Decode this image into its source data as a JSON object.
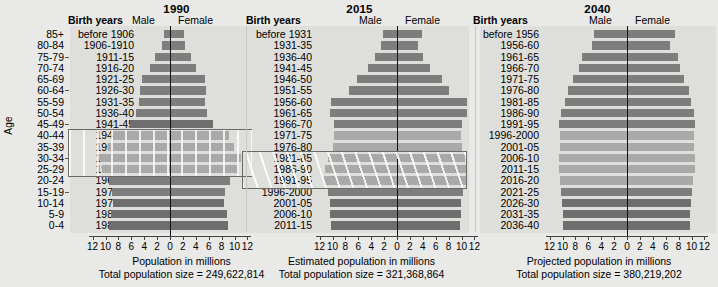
{
  "axis": {
    "age_title": "Age",
    "age_groups": [
      "85+",
      "80-84",
      "75-79",
      "70-74",
      "65-69",
      "60-64",
      "55-59",
      "50-54",
      "45-49",
      "40-44",
      "35-39",
      "30-34",
      "25-29",
      "20-24",
      "15-19",
      "10-14",
      "5-9",
      "0-4"
    ],
    "age_ticks_at": [
      "75-79",
      "60-64",
      "45-49",
      "30-34",
      "15-19"
    ],
    "x_tick_labels": [
      "12",
      "10",
      "8",
      "6",
      "4",
      "2",
      "0",
      "2",
      "4",
      "6",
      "8",
      "10",
      "12"
    ],
    "x_tick_values": [
      -12,
      -10,
      -8,
      -6,
      -4,
      -2,
      0,
      2,
      4,
      6,
      8,
      10,
      12
    ],
    "xlim": [
      -13,
      13
    ]
  },
  "headers": {
    "birth_years": "Birth years",
    "male": "Male",
    "female": "Female"
  },
  "colors": {
    "bar_dark": "#6e6e6e",
    "bar_mid": "#7d7d7d",
    "bar_light": "#a9a9a9",
    "plot_bg": "#dededa",
    "page_bg": "#e9e9e7",
    "zero_line": "#111111",
    "hatch_border": "#6a6a6a"
  },
  "chart_data": {
    "type": "bar",
    "xlabel": "Population in millions",
    "ylabel": "Age",
    "grid": false,
    "legend": [
      "Male",
      "Female"
    ],
    "legend_position": "top",
    "panels": [
      {
        "title": "1990",
        "xlabel": "Population in millions",
        "total_label": "Total population size = 249,622,814",
        "total_population": 249622814,
        "highlight": {
          "label": "baby boom cohort",
          "style": "slanted-hatch",
          "rows": [
            "40-44",
            "35-39",
            "30-34",
            "25-29"
          ]
        },
        "rows": [
          {
            "age": "85+",
            "birth_years": "before 1906",
            "male": 1.0,
            "female": 2.2,
            "shade": "mid"
          },
          {
            "age": "80-84",
            "birth_years": "1906-1910",
            "male": 1.3,
            "female": 2.3,
            "shade": "mid"
          },
          {
            "age": "75-79",
            "birth_years": "1911-15",
            "male": 2.3,
            "female": 3.3,
            "shade": "mid"
          },
          {
            "age": "70-74",
            "birth_years": "1916-20",
            "male": 3.1,
            "female": 4.1,
            "shade": "mid"
          },
          {
            "age": "65-69",
            "birth_years": "1921-25",
            "male": 4.3,
            "female": 5.5,
            "shade": "mid"
          },
          {
            "age": "60-64",
            "birth_years": "1926-30",
            "male": 4.7,
            "female": 5.6,
            "shade": "mid"
          },
          {
            "age": "55-59",
            "birth_years": "1931-35",
            "male": 4.8,
            "female": 5.4,
            "shade": "mid"
          },
          {
            "age": "50-54",
            "birth_years": "1936-40",
            "male": 5.3,
            "female": 5.8,
            "shade": "mid"
          },
          {
            "age": "45-49",
            "birth_years": "1941-45",
            "male": 6.2,
            "female": 6.6,
            "shade": "dark"
          },
          {
            "age": "40-44",
            "birth_years": "1946-50",
            "male": 8.9,
            "female": 9.2,
            "shade": "light"
          },
          {
            "age": "35-39",
            "birth_years": "1951-55",
            "male": 9.6,
            "female": 9.9,
            "shade": "light"
          },
          {
            "age": "30-34",
            "birth_years": "1956-60",
            "male": 10.9,
            "female": 11.0,
            "shade": "light"
          },
          {
            "age": "25-29",
            "birth_years": "1961-65",
            "male": 10.6,
            "female": 10.7,
            "shade": "light"
          },
          {
            "age": "20-24",
            "birth_years": "1966-70",
            "male": 9.4,
            "female": 9.3,
            "shade": "mid"
          },
          {
            "age": "15-19",
            "birth_years": "1971-75",
            "male": 9.0,
            "female": 8.6,
            "shade": "mid"
          },
          {
            "age": "10-14",
            "birth_years": "1976-80",
            "male": 8.8,
            "female": 8.4,
            "shade": "dark"
          },
          {
            "age": "5-9",
            "birth_years": "1981-85",
            "male": 9.2,
            "female": 8.8,
            "shade": "dark"
          },
          {
            "age": "0-4",
            "birth_years": "1986-90",
            "male": 9.4,
            "female": 9.0,
            "shade": "dark"
          }
        ]
      },
      {
        "title": "2015",
        "xlabel": "Estimated population in millions",
        "total_label": "Total population size = 321,368,864",
        "total_population": 321368864,
        "highlight": {
          "label": "baby boom echo cohort",
          "style": "slanted-hatch",
          "rows": [
            "30-34",
            "25-29",
            "20-24"
          ]
        },
        "rows": [
          {
            "age": "85+",
            "birth_years": "before 1931",
            "male": 2.1,
            "female": 3.9,
            "shade": "mid"
          },
          {
            "age": "80-84",
            "birth_years": "1931-35",
            "male": 2.5,
            "female": 3.3,
            "shade": "mid"
          },
          {
            "age": "75-79",
            "birth_years": "1936-40",
            "male": 3.4,
            "female": 4.1,
            "shade": "mid"
          },
          {
            "age": "70-74",
            "birth_years": "1941-45",
            "male": 4.5,
            "female": 5.1,
            "shade": "mid"
          },
          {
            "age": "65-69",
            "birth_years": "1946-50",
            "male": 6.2,
            "female": 6.9,
            "shade": "mid"
          },
          {
            "age": "60-64",
            "birth_years": "1951-55",
            "male": 7.5,
            "female": 8.1,
            "shade": "mid"
          },
          {
            "age": "55-59",
            "birth_years": "1956-60",
            "male": 10.2,
            "female": 10.9,
            "shade": "mid"
          },
          {
            "age": "50-54",
            "birth_years": "1961-65",
            "male": 10.4,
            "female": 10.8,
            "shade": "mid"
          },
          {
            "age": "45-49",
            "birth_years": "1966-70",
            "male": 9.8,
            "female": 10.0,
            "shade": "mid"
          },
          {
            "age": "40-44",
            "birth_years": "1971-75",
            "male": 9.8,
            "female": 9.9,
            "shade": "light"
          },
          {
            "age": "35-39",
            "birth_years": "1976-80",
            "male": 9.9,
            "female": 10.0,
            "shade": "light"
          },
          {
            "age": "30-34",
            "birth_years": "1981-85",
            "male": 10.7,
            "female": 10.6,
            "shade": "light"
          },
          {
            "age": "25-29",
            "birth_years": "1986-90",
            "male": 11.2,
            "female": 10.9,
            "shade": "light"
          },
          {
            "age": "20-24",
            "birth_years": "1991-95",
            "male": 11.3,
            "female": 10.8,
            "shade": "light"
          },
          {
            "age": "15-19",
            "birth_years": "1996-2000",
            "male": 10.7,
            "female": 10.2,
            "shade": "mid"
          },
          {
            "age": "10-14",
            "birth_years": "2001-05",
            "male": 10.4,
            "female": 9.9,
            "shade": "dark"
          },
          {
            "age": "5-9",
            "birth_years": "2006-10",
            "male": 10.4,
            "female": 9.9,
            "shade": "dark"
          },
          {
            "age": "0-4",
            "birth_years": "2011-15",
            "male": 10.2,
            "female": 9.7,
            "shade": "dark"
          }
        ]
      },
      {
        "title": "2040",
        "xlabel": "Projected population in millions",
        "total_label": "Total population size = 380,219,202",
        "total_population": 380219202,
        "highlight": null,
        "rows": [
          {
            "age": "85+",
            "birth_years": "before 1956",
            "male": 5.1,
            "female": 7.4,
            "shade": "mid"
          },
          {
            "age": "80-84",
            "birth_years": "1956-60",
            "male": 5.4,
            "female": 6.6,
            "shade": "mid"
          },
          {
            "age": "75-79",
            "birth_years": "1961-65",
            "male": 6.9,
            "female": 7.9,
            "shade": "mid"
          },
          {
            "age": "70-74",
            "birth_years": "1966-70",
            "male": 7.4,
            "female": 8.2,
            "shade": "mid"
          },
          {
            "age": "65-69",
            "birth_years": "1971-75",
            "male": 8.3,
            "female": 8.9,
            "shade": "mid"
          },
          {
            "age": "60-64",
            "birth_years": "1976-80",
            "male": 9.2,
            "female": 9.6,
            "shade": "mid"
          },
          {
            "age": "55-59",
            "birth_years": "1981-85",
            "male": 9.6,
            "female": 9.9,
            "shade": "mid"
          },
          {
            "age": "50-54",
            "birth_years": "1986-90",
            "male": 10.2,
            "female": 10.4,
            "shade": "mid"
          },
          {
            "age": "45-49",
            "birth_years": "1991-95",
            "male": 10.6,
            "female": 10.6,
            "shade": "mid"
          },
          {
            "age": "40-44",
            "birth_years": "1996-2000",
            "male": 10.4,
            "female": 10.4,
            "shade": "light"
          },
          {
            "age": "35-39",
            "birth_years": "2001-05",
            "male": 10.4,
            "female": 10.4,
            "shade": "light"
          },
          {
            "age": "30-34",
            "birth_years": "2006-10",
            "male": 10.5,
            "female": 10.5,
            "shade": "light"
          },
          {
            "age": "25-29",
            "birth_years": "2011-15",
            "male": 10.5,
            "female": 10.5,
            "shade": "light"
          },
          {
            "age": "20-24",
            "birth_years": "2016-20",
            "male": 10.4,
            "female": 10.3,
            "shade": "light"
          },
          {
            "age": "15-19",
            "birth_years": "2021-25",
            "male": 10.2,
            "female": 10.1,
            "shade": "mid"
          },
          {
            "age": "10-14",
            "birth_years": "2026-30",
            "male": 10.1,
            "female": 9.9,
            "shade": "dark"
          },
          {
            "age": "5-9",
            "birth_years": "2031-35",
            "male": 10.0,
            "female": 9.8,
            "shade": "dark"
          },
          {
            "age": "0-4",
            "birth_years": "2036-40",
            "male": 9.9,
            "female": 9.7,
            "shade": "dark"
          }
        ]
      }
    ]
  }
}
